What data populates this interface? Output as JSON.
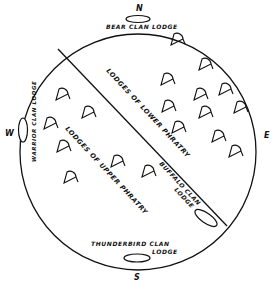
{
  "diagram": {
    "compass": {
      "north": "N",
      "south": "S",
      "east": "E",
      "west": "W"
    },
    "labels": {
      "bear_lodge": "BEAR CLAN LODGE",
      "warrior_lodge": "WARRIOR CLAN LODGE",
      "thunderbird_line1": "THUNDERBIRD CLAN",
      "thunderbird_line2": "LODGE",
      "buffalo_line1": "BUFFALO CLAN",
      "buffalo_line2": "LODGE",
      "lower_phratry": "LODGES OF LOWER PHRATRY",
      "upper_phratry": "LODGES OF UPPER PHRATRY"
    },
    "colors": {
      "ink": "#111111",
      "paper": "#ffffff"
    },
    "lower_phratry_lodges": [
      [
        177,
        40
      ],
      [
        205,
        65
      ],
      [
        167,
        80
      ],
      [
        200,
        95
      ],
      [
        225,
        90
      ],
      [
        168,
        107
      ],
      [
        205,
        113
      ],
      [
        240,
        108
      ],
      [
        178,
        128
      ],
      [
        218,
        137
      ],
      [
        235,
        152
      ]
    ],
    "upper_phratry_lodges": [
      [
        62,
        95
      ],
      [
        88,
        113
      ],
      [
        50,
        124
      ],
      [
        63,
        147
      ],
      [
        117,
        162
      ],
      [
        70,
        178
      ],
      [
        148,
        172
      ]
    ]
  }
}
